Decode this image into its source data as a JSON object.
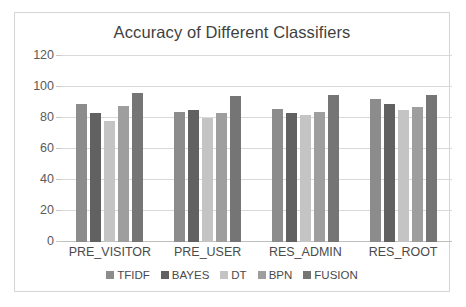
{
  "chart_data": {
    "type": "bar",
    "title": "Accuracy of Different Classifiers",
    "xlabel": "",
    "ylabel": "",
    "ylim": [
      0,
      120
    ],
    "yticks": [
      0,
      20,
      40,
      60,
      80,
      100,
      120
    ],
    "grid": true,
    "legend_position": "bottom",
    "categories": [
      "PRE_VISITOR",
      "PRE_USER",
      "RES_ADMIN",
      "RES_ROOT"
    ],
    "series": [
      {
        "name": "TFIDF",
        "color": "#8c8c8c",
        "values": [
          89,
          84,
          86,
          92
        ]
      },
      {
        "name": "BAYES",
        "color": "#616161",
        "values": [
          83,
          85,
          83,
          89
        ]
      },
      {
        "name": "DT",
        "color": "#c4c4c4",
        "values": [
          78,
          80,
          82,
          85
        ]
      },
      {
        "name": "BPN",
        "color": "#9e9e9e",
        "values": [
          88,
          83,
          84,
          87
        ]
      },
      {
        "name": "FUSION",
        "color": "#757575",
        "values": [
          96,
          94,
          95,
          95
        ]
      }
    ]
  },
  "axis": {
    "tick_labels": [
      "120",
      "100",
      "80",
      "60",
      "40",
      "20",
      "0"
    ]
  },
  "legend": {
    "items": [
      {
        "label": "TFIDF"
      },
      {
        "label": "BAYES"
      },
      {
        "label": "DT"
      },
      {
        "label": "BPN"
      },
      {
        "label": "FUSION"
      }
    ]
  },
  "colors": {
    "gridline": "#d9d9d9",
    "border": "#d4d4d4",
    "text": "#4a4a4a",
    "title_text": "#3f3f3f"
  }
}
